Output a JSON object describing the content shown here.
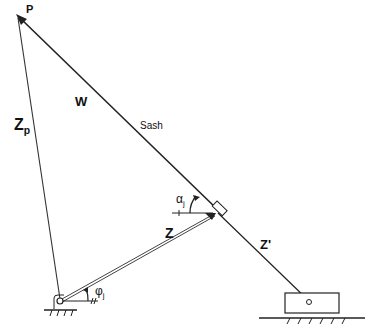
{
  "diagram": {
    "labels": {
      "P": "P",
      "W": "W",
      "sash": "Sash",
      "Zp": "Z",
      "Zp_sub": "p",
      "Z": "Z",
      "Zprime": "Z'",
      "alpha": "α",
      "alpha_sub": "j",
      "phi": "φ",
      "phi_sub": "j"
    },
    "points": {
      "P": [
        18,
        16
      ],
      "pivot": [
        60,
        300
      ],
      "joint": [
        215,
        212
      ],
      "slider_pin": [
        309,
        302
      ]
    },
    "colors": {
      "line": "#222222",
      "background": "#ffffff"
    }
  }
}
